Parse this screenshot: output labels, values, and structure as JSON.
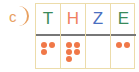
{
  "label": "c",
  "colors": {
    "label": "#e8a060",
    "dot": "#f07848",
    "border": "#ecdcaa",
    "separator": "#777777"
  },
  "columns": [
    {
      "header": "T",
      "color": "#3a8a5a",
      "count": 3
    },
    {
      "header": "H",
      "color": "#f08060",
      "count": 5
    },
    {
      "header": "Z",
      "color": "#4a70c0",
      "count": 0
    },
    {
      "header": "E",
      "color": "#3a8a5a",
      "count": 2
    }
  ]
}
